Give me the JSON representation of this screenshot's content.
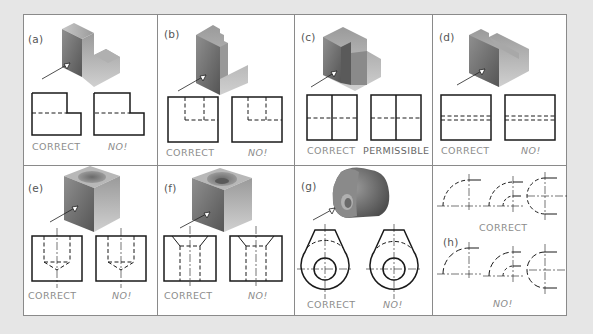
{
  "figure": {
    "colors": {
      "background": "#e6e6e6",
      "panel": "#ffffff",
      "border": "#8a8a8a",
      "line": "#1a1a1a",
      "caption": "#8c8c8c"
    },
    "panels": [
      {
        "id": "a",
        "label": "(a)",
        "captions": [
          "CORRECT",
          "NO!"
        ]
      },
      {
        "id": "b",
        "label": "(b)",
        "captions": [
          "CORRECT",
          "NO!"
        ]
      },
      {
        "id": "c",
        "label": "(c)",
        "captions": [
          "CORRECT",
          "PERMISSIBLE"
        ]
      },
      {
        "id": "d",
        "label": "(d)",
        "captions": [
          "CORRECT",
          "NO!"
        ]
      },
      {
        "id": "e",
        "label": "(e)",
        "captions": [
          "CORRECT",
          "NO!"
        ]
      },
      {
        "id": "f",
        "label": "(f)",
        "captions": [
          "CORRECT",
          "NO!"
        ]
      },
      {
        "id": "g",
        "label": "(g)",
        "captions": [
          "CORRECT",
          "NO!"
        ]
      },
      {
        "id": "h",
        "label": "(h)",
        "captions": [
          "CORRECT",
          "NO!"
        ]
      }
    ]
  }
}
